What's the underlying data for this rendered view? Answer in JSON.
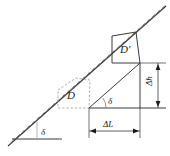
{
  "figure": {
    "title": "",
    "background_color": "#ffffff",
    "line_color": "#3a3a3a",
    "dash_color": "#8a8a8a",
    "labels": {
      "d_prime": "D′",
      "d": "D",
      "delta_lower_left": "δ",
      "delta_apex": "δ",
      "delta_h": "Δh",
      "delta_l": "ΔL"
    },
    "elements": {
      "slope_line": "hatched-slope-line",
      "ground_line": "ground-baseline",
      "displaced_block": "quadrilateral-d-prime",
      "original_block": "dashed-quadrilateral-d",
      "triangle": "displacement-triangle",
      "vertical_dimension": "delta-h-dimension",
      "horizontal_dimension": "delta-l-dimension"
    }
  },
  "geometry": {
    "slope_start": [
      8,
      146
    ],
    "slope_end": [
      166,
      6
    ],
    "ground_y": 139,
    "ground_x1": 12,
    "ground_x2": 62,
    "apex": [
      89,
      108
    ],
    "top_right": [
      140,
      63
    ],
    "mid_line_y": 108,
    "mid_line_x2": 166,
    "delta_h_top": 63,
    "delta_h_bottom": 108,
    "delta_l_left": 89,
    "delta_l_right": 140,
    "delta_l_y": 131
  }
}
